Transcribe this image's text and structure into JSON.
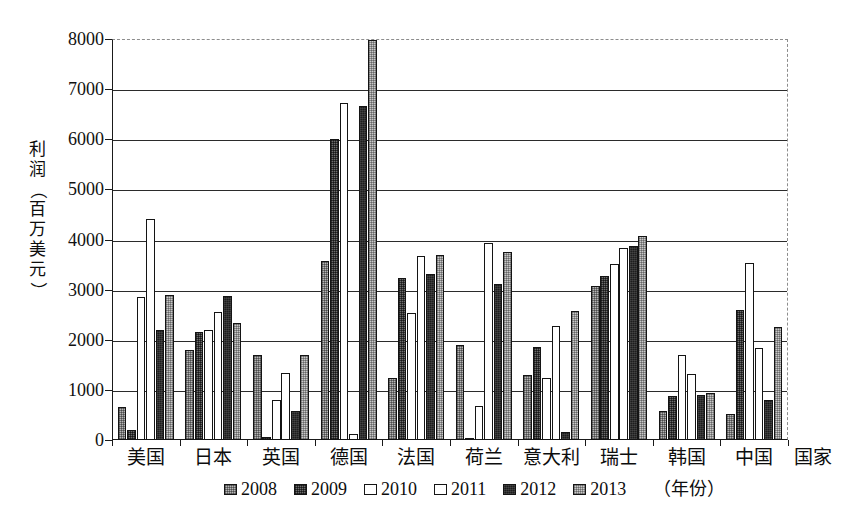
{
  "chart_data": {
    "type": "bar",
    "title": "",
    "xlabel": "国家",
    "ylabel": "利润（百万美元）",
    "ylabel_chars": [
      "利",
      "润",
      "（",
      "百",
      "万",
      "美",
      "元",
      "）"
    ],
    "ylim": [
      0,
      8000
    ],
    "ytick_labels": [
      "8000",
      "7000",
      "6000",
      "5000",
      "4000",
      "3000",
      "2000",
      "1000",
      "0"
    ],
    "ytick_values": [
      8000,
      7000,
      6000,
      5000,
      4000,
      3000,
      2000,
      1000,
      0
    ],
    "grid": "horizontal",
    "legend_position": "bottom",
    "legend_suffix": "（年份）",
    "categories": [
      "美国",
      "日本",
      "英国",
      "德国",
      "法国",
      "荷兰",
      "意大利",
      "瑞士",
      "韩国",
      "中国"
    ],
    "series": [
      {
        "name": "2008",
        "values": [
          650,
          1800,
          1700,
          3580,
          1230,
          1900,
          1300,
          3080,
          580,
          510
        ]
      },
      {
        "name": "2009",
        "values": [
          200,
          2150,
          60,
          6000,
          3230,
          40,
          1850,
          3270,
          880,
          2600
        ]
      },
      {
        "name": "2010",
        "values": [
          2850,
          2200,
          800,
          6720,
          2540,
          670,
          1240,
          3520,
          1690,
          3540
        ]
      },
      {
        "name": "2011",
        "values": [
          4400,
          2550,
          1330,
          120,
          3680,
          3930,
          2280,
          3830,
          1320,
          1830
        ]
      },
      {
        "name": "2012",
        "values": [
          2200,
          2870,
          580,
          6660,
          3310,
          3120,
          150,
          3880,
          900,
          800
        ]
      },
      {
        "name": "2013",
        "values": [
          2900,
          2330,
          1690,
          7980,
          3700,
          3750,
          2570,
          4070,
          940,
          2260
        ]
      }
    ]
  },
  "legend": {
    "items": [
      {
        "label": "2008"
      },
      {
        "label": "2009"
      },
      {
        "label": "2010"
      },
      {
        "label": "2011"
      },
      {
        "label": "2012"
      },
      {
        "label": "2013"
      }
    ],
    "suffix": "（年份）"
  }
}
